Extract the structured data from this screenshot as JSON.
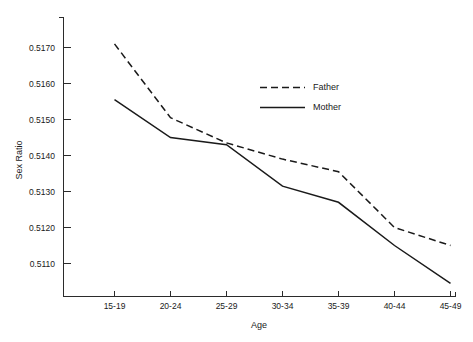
{
  "chart_data": {
    "type": "line",
    "title": "",
    "subtitle": "",
    "xlabel": "Age",
    "ylabel": "Sex Ratio",
    "categories": [
      "15-19",
      "20-24",
      "25-29",
      "30-34",
      "35-39",
      "40-44",
      "45-49"
    ],
    "ylim": [
      0.5103,
      0.5175
    ],
    "yticks": [
      0.511,
      0.512,
      0.513,
      0.514,
      0.515,
      0.516,
      0.517
    ],
    "ytick_labels": [
      "0.5110",
      "0.5120",
      "0.5130",
      "0.5140",
      "0.5150",
      "0.5160",
      "0.5170"
    ],
    "grid": false,
    "legend_position": "upper-right",
    "series": [
      {
        "name": "Father",
        "style": "dashed",
        "color": "#1a1a1a",
        "values": [
          0.5171,
          0.51505,
          0.51435,
          0.5139,
          0.51355,
          0.512,
          0.5115
        ]
      },
      {
        "name": "Mother",
        "style": "solid",
        "color": "#1a1a1a",
        "values": [
          0.51555,
          0.5145,
          0.5143,
          0.51315,
          0.5127,
          0.5115,
          0.51045
        ]
      }
    ]
  },
  "legend": {
    "entries": [
      {
        "label": "Father"
      },
      {
        "label": "Mother"
      }
    ]
  },
  "axes": {
    "y_axis_title": "Sex Ratio",
    "x_axis_title": "Age"
  }
}
